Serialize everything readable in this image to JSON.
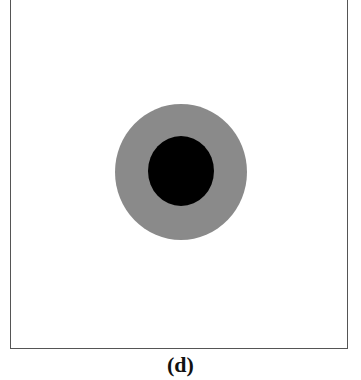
{
  "figure": {
    "panel_label": "(d)",
    "outer_circle": {
      "cx": 181,
      "cy": 172,
      "rx": 66,
      "ry": 68,
      "color": "#8a8a8a"
    },
    "inner_circle": {
      "cx": 181,
      "cy": 171,
      "rx": 33,
      "ry": 35,
      "color": "#000000"
    }
  }
}
